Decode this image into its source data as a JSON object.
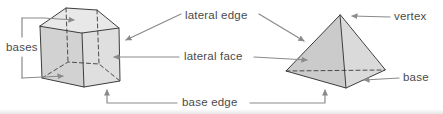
{
  "figure": {
    "type": "geometry-diagram",
    "shapes": [
      "pentagonal-prism",
      "pyramid"
    ]
  },
  "labels": {
    "bases": "bases",
    "lateral_edge": "lateral edge",
    "lateral_face": "lateral face",
    "base_edge": "base edge",
    "vertex": "vertex",
    "base": "base"
  },
  "colors": {
    "background": "#ffffff",
    "label_text": "#4a4a4a",
    "leader_line": "#8a8a8a",
    "shape_outline": "#3c3c3c",
    "hidden_edge": "#4a4a4a",
    "face_top": "#e8e8e8",
    "face_left": "#d2d2d2",
    "face_right": "#dfdfdf",
    "pyramid_left": "#cbcbcb",
    "pyramid_right": "#dadada"
  }
}
